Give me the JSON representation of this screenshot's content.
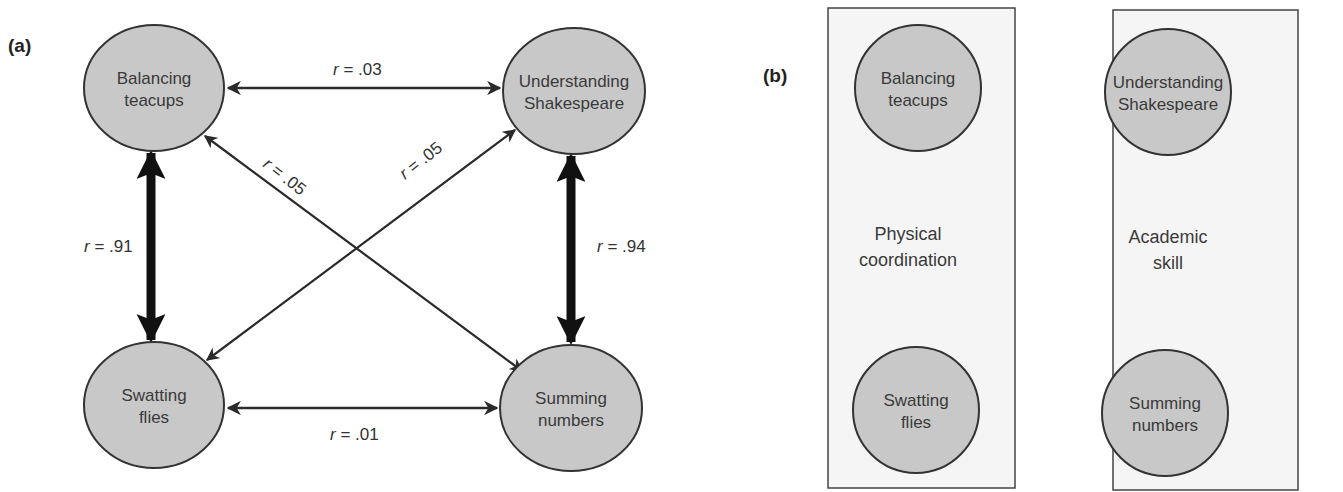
{
  "panel_a": {
    "label": "(a)",
    "nodes": {
      "balancing": {
        "line1": "Balancing",
        "line2": "teacups"
      },
      "understanding": {
        "line1": "Understanding",
        "line2": "Shakespeare"
      },
      "swatting": {
        "line1": "Swatting",
        "line2": "flies"
      },
      "summing": {
        "line1": "Summing",
        "line2": "numbers"
      }
    },
    "edges": {
      "top": {
        "r": "r",
        "value": " = .03"
      },
      "bottom": {
        "r": "r",
        "value": " = .01"
      },
      "left": {
        "r": "r",
        "value": " = .91"
      },
      "right": {
        "r": "r",
        "value": " = .94"
      },
      "diag_down": {
        "r": "r",
        "value": " = .05"
      },
      "diag_up": {
        "r": "r",
        "value": " = .05"
      }
    }
  },
  "panel_b": {
    "label": "(b)",
    "groups": [
      {
        "factor_line1": "Physical",
        "factor_line2": "coordination",
        "top": {
          "line1": "Balancing",
          "line2": "teacups"
        },
        "bottom": {
          "line1": "Swatting",
          "line2": "flies"
        }
      },
      {
        "factor_line1": "Academic",
        "factor_line2": "skill",
        "top": {
          "line1": "Understanding",
          "line2": "Shakespeare"
        },
        "bottom": {
          "line1": "Summing",
          "line2": "numbers"
        }
      }
    ]
  },
  "colors": {
    "node_fill": "#c8c8c8",
    "node_stroke": "#333333",
    "box_fill": "#f5f5f5",
    "arrow": "#2a2a2a"
  }
}
